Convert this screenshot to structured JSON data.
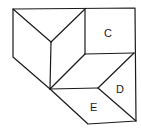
{
  "diagram": {
    "type": "geometric-figure",
    "labels": [
      {
        "id": "C",
        "text": "C",
        "x": 104,
        "y": 37
      },
      {
        "id": "D",
        "text": "D",
        "x": 116,
        "y": 93
      },
      {
        "id": "E",
        "text": "E",
        "x": 90,
        "y": 111
      }
    ],
    "colors": {
      "stroke": "#1a1a1a",
      "background": "#ffffff"
    }
  }
}
